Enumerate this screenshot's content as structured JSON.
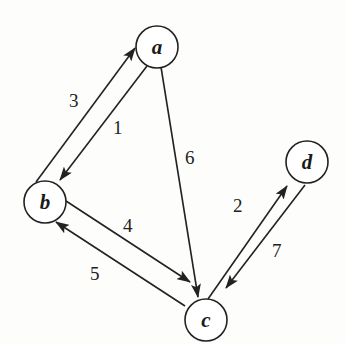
{
  "graph": {
    "type": "directed-weighted",
    "nodes": [
      {
        "id": "a",
        "label": "a",
        "x": 157,
        "y": 47
      },
      {
        "id": "b",
        "label": "b",
        "x": 45,
        "y": 202
      },
      {
        "id": "c",
        "label": "c",
        "x": 206,
        "y": 320
      },
      {
        "id": "d",
        "label": "d",
        "x": 307,
        "y": 162
      }
    ],
    "edges": [
      {
        "from": "b",
        "to": "a",
        "weight": "3"
      },
      {
        "from": "a",
        "to": "b",
        "weight": "1"
      },
      {
        "from": "a",
        "to": "c",
        "weight": "6"
      },
      {
        "from": "b",
        "to": "c",
        "weight": "4"
      },
      {
        "from": "c",
        "to": "b",
        "weight": "5"
      },
      {
        "from": "c",
        "to": "d",
        "weight": "2"
      },
      {
        "from": "d",
        "to": "c",
        "weight": "7"
      }
    ]
  },
  "labels": {
    "node_a": "a",
    "node_b": "b",
    "node_c": "c",
    "node_d": "d",
    "w_ba": "3",
    "w_ab": "1",
    "w_ac": "6",
    "w_bc": "4",
    "w_cb": "5",
    "w_cd": "2",
    "w_dc": "7"
  }
}
